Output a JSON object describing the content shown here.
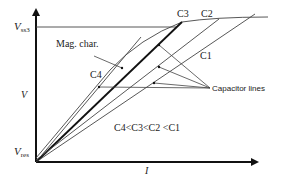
{
  "diagram": {
    "axes": {
      "y_label": "V",
      "x_label": "I",
      "y_top_tick_main": "V",
      "y_top_tick_sub": "ss3",
      "y_bottom_tick_main": "V",
      "y_bottom_tick_sub": "res"
    },
    "curves": {
      "magnetization_label": "Mag. char.",
      "capacitor_lines_label": "Capacitor lines",
      "c1_label": "C1",
      "c2_label": "C2",
      "c3_label": "C3",
      "c4_label": "C4"
    },
    "relation_text": "C4<C3<C2 <C1",
    "colors": {
      "line": "#333333",
      "thick_line": "#111111",
      "background": "#ffffff"
    }
  }
}
